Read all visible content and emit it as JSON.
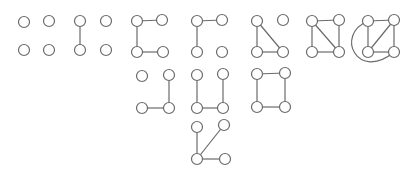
{
  "diagram": {
    "title": "",
    "style": {
      "stroke": "#6a6a6a",
      "node_fill": "#ffffff",
      "node_radius": 5.5
    },
    "graphs": [
      {
        "id": "g-empty",
        "nodes": [
          [
            24,
            22
          ],
          [
            49,
            21
          ],
          [
            24,
            50
          ],
          [
            49,
            50
          ]
        ],
        "edges": []
      },
      {
        "id": "g-one-edge",
        "nodes": [
          [
            80,
            21
          ],
          [
            106,
            21
          ],
          [
            80,
            50
          ],
          [
            106,
            50
          ]
        ],
        "edges": [
          [
            0,
            2
          ]
        ]
      },
      {
        "id": "g-path-c",
        "nodes": [
          [
            137,
            21
          ],
          [
            162,
            20
          ],
          [
            137,
            52
          ],
          [
            163,
            52
          ]
        ],
        "edges": [
          [
            0,
            1
          ],
          [
            0,
            2
          ],
          [
            2,
            3
          ]
        ]
      },
      {
        "id": "g-path-gamma",
        "nodes": [
          [
            197,
            21
          ],
          [
            222,
            20
          ],
          [
            197,
            52
          ],
          [
            222,
            52
          ]
        ],
        "edges": [
          [
            0,
            1
          ],
          [
            0,
            2
          ]
        ]
      },
      {
        "id": "g-triangle-isolated",
        "nodes": [
          [
            257,
            21
          ],
          [
            283,
            20
          ],
          [
            257,
            52
          ],
          [
            283,
            52
          ]
        ],
        "edges": [
          [
            0,
            2
          ],
          [
            0,
            3
          ],
          [
            2,
            3
          ]
        ]
      },
      {
        "id": "g-square-diagonal",
        "nodes": [
          [
            312,
            21
          ],
          [
            339,
            20
          ],
          [
            312,
            52
          ],
          [
            339,
            52
          ]
        ],
        "edges": [
          [
            0,
            1
          ],
          [
            0,
            2
          ],
          [
            1,
            3
          ],
          [
            2,
            3
          ],
          [
            0,
            3
          ]
        ]
      },
      {
        "id": "g-complete-k4",
        "nodes": [
          [
            368,
            21
          ],
          [
            394,
            20
          ],
          [
            368,
            52
          ],
          [
            394,
            52
          ]
        ],
        "edges": [
          [
            0,
            1
          ],
          [
            0,
            2
          ],
          [
            1,
            3
          ],
          [
            2,
            3
          ],
          [
            1,
            2
          ]
        ],
        "arcs": [
          [
            0,
            3
          ]
        ]
      },
      {
        "id": "g-path-l",
        "nodes": [
          [
            142,
            76
          ],
          [
            169,
            75
          ],
          [
            142,
            108
          ],
          [
            169,
            108
          ]
        ],
        "edges": [
          [
            1,
            3
          ],
          [
            2,
            3
          ]
        ]
      },
      {
        "id": "g-path-u",
        "nodes": [
          [
            197,
            75
          ],
          [
            223,
            74
          ],
          [
            197,
            108
          ],
          [
            223,
            108
          ]
        ],
        "edges": [
          [
            0,
            2
          ],
          [
            2,
            3
          ],
          [
            1,
            3
          ]
        ]
      },
      {
        "id": "g-cycle-c4",
        "nodes": [
          [
            257,
            74
          ],
          [
            285,
            73
          ],
          [
            257,
            107
          ],
          [
            285,
            107
          ]
        ],
        "edges": [
          [
            0,
            1
          ],
          [
            0,
            2
          ],
          [
            1,
            3
          ],
          [
            2,
            3
          ]
        ]
      },
      {
        "id": "g-star",
        "nodes": [
          [
            197,
            127
          ],
          [
            224,
            125
          ],
          [
            197,
            159
          ],
          [
            225,
            159
          ]
        ],
        "edges": [
          [
            0,
            2
          ],
          [
            1,
            2
          ],
          [
            2,
            3
          ]
        ]
      }
    ]
  }
}
